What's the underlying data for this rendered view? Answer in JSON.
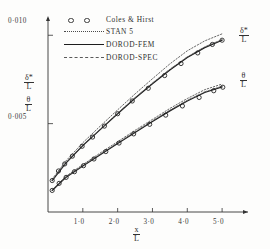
{
  "figure": {
    "background": "#fdfdfc",
    "ink": "#2b2b2b"
  },
  "axes": {
    "x_label_num": "x",
    "x_label_den": "L",
    "y_label_1_num": "δ*",
    "y_label_1_den": "L",
    "y_label_2_num": "θ",
    "y_label_2_den": "L",
    "x_ticks": [
      "1·0",
      "2·0",
      "3·0",
      "4·0",
      "5·0"
    ],
    "x_tick_values": [
      1.0,
      2.0,
      3.0,
      4.0,
      5.0
    ],
    "y_ticks": [
      "0·010",
      "0·005"
    ],
    "y_tick_values": [
      0.01,
      0.005
    ],
    "xlim": [
      0.0,
      5.6
    ],
    "ylim": [
      0.0,
      0.01075
    ],
    "grid": false
  },
  "legend": {
    "position": "top-left-inside",
    "items": [
      {
        "label": "Coles & Hirst",
        "style": "markers",
        "marker": "open-circle"
      },
      {
        "label": "STAN 5",
        "style": "dotted"
      },
      {
        "label": "DOROD-FEM",
        "style": "solid"
      },
      {
        "label": "DOROD-SPEC",
        "style": "dash-dot"
      }
    ]
  },
  "curve_labels": {
    "upper_num": "δ*",
    "upper_den": "L",
    "lower_num": "θ",
    "lower_den": "L"
  },
  "chart_data": {
    "type": "line",
    "title": "",
    "xlabel": "x/L",
    "ylabel": "δ*/L , θ/L",
    "xlim": [
      0.0,
      5.6
    ],
    "ylim": [
      0.0,
      0.01075
    ],
    "grid": false,
    "legend_position": "top-left-inside",
    "series": [
      {
        "name": "Coles & Hirst (δ*/L)",
        "style": "markers",
        "marker": "open-circle",
        "x": [
          0.12,
          0.3,
          0.48,
          0.7,
          0.98,
          1.28,
          1.62,
          2.0,
          2.42,
          2.88,
          3.35,
          3.82,
          4.3,
          4.72,
          5.0
        ],
        "y": [
          0.00178,
          0.00232,
          0.00272,
          0.00316,
          0.00372,
          0.00424,
          0.00486,
          0.00556,
          0.00628,
          0.007,
          0.00772,
          0.0084,
          0.009,
          0.00948,
          0.00972
        ]
      },
      {
        "name": "DOROD-FEM (δ*/L)",
        "style": "solid",
        "x": [
          0.12,
          0.5,
          1.0,
          1.5,
          2.0,
          2.5,
          3.0,
          3.5,
          4.0,
          4.5,
          5.0
        ],
        "y": [
          0.00178,
          0.00274,
          0.00376,
          0.00466,
          0.00556,
          0.00644,
          0.00726,
          0.00804,
          0.00874,
          0.0093,
          0.00972
        ]
      },
      {
        "name": "STAN 5 (δ*/L)",
        "style": "dotted",
        "x": [
          0.12,
          0.5,
          1.0,
          1.5,
          2.0,
          2.5,
          3.0,
          3.5,
          4.0,
          4.5,
          5.0
        ],
        "y": [
          0.00186,
          0.00286,
          0.00392,
          0.00486,
          0.00578,
          0.00668,
          0.00754,
          0.00838,
          0.00912,
          0.00968,
          0.01008
        ]
      },
      {
        "name": "DOROD-SPEC (δ*/L)",
        "style": "dash-dot",
        "x": [
          0.12,
          0.5,
          1.0,
          1.5,
          2.0,
          2.5,
          3.0,
          3.5,
          4.0,
          4.5,
          5.0
        ],
        "y": [
          0.0018,
          0.00276,
          0.00379,
          0.00469,
          0.00559,
          0.00647,
          0.0073,
          0.00808,
          0.00878,
          0.00934,
          0.00976
        ]
      },
      {
        "name": "Coles & Hirst (θ/L)",
        "style": "markers",
        "marker": "open-circle",
        "x": [
          0.12,
          0.32,
          0.52,
          0.76,
          1.02,
          1.32,
          1.66,
          2.04,
          2.46,
          2.92,
          3.38,
          3.86,
          4.34,
          4.76,
          5.02
        ],
        "y": [
          0.00122,
          0.00162,
          0.00196,
          0.00228,
          0.00262,
          0.003,
          0.00342,
          0.0039,
          0.00442,
          0.00496,
          0.00548,
          0.006,
          0.00648,
          0.00686,
          0.00706
        ]
      },
      {
        "name": "DOROD-FEM (θ/L)",
        "style": "solid",
        "x": [
          0.12,
          0.5,
          1.0,
          1.5,
          2.0,
          2.5,
          3.0,
          3.5,
          4.0,
          4.5,
          5.0
        ],
        "y": [
          0.00122,
          0.00194,
          0.0026,
          0.00324,
          0.00388,
          0.0045,
          0.00512,
          0.00572,
          0.00628,
          0.00676,
          0.00708
        ]
      },
      {
        "name": "STAN 5 (θ/L)",
        "style": "dotted",
        "x": [
          0.12,
          0.5,
          1.0,
          1.5,
          2.0,
          2.5,
          3.0,
          3.5,
          4.0,
          4.5,
          5.0
        ],
        "y": [
          0.00126,
          0.002,
          0.00268,
          0.00334,
          0.00398,
          0.00462,
          0.00524,
          0.00586,
          0.00642,
          0.00692,
          0.00724
        ]
      },
      {
        "name": "DOROD-SPEC (θ/L)",
        "style": "dash-dot",
        "x": [
          0.12,
          0.5,
          1.0,
          1.5,
          2.0,
          2.5,
          3.0,
          3.5,
          4.0,
          4.5,
          5.0
        ],
        "y": [
          0.00124,
          0.00196,
          0.00263,
          0.00327,
          0.00391,
          0.00454,
          0.00516,
          0.00576,
          0.00632,
          0.0068,
          0.00712
        ]
      }
    ]
  }
}
